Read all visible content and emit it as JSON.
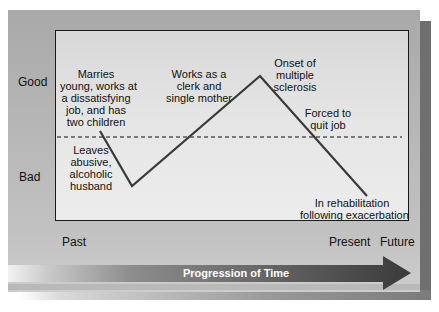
{
  "y_axis": {
    "good_label": "Good",
    "bad_label": "Bad"
  },
  "x_axis": {
    "past_label": "Past",
    "present_label": "Present",
    "future_label": "Future"
  },
  "arrow": {
    "label": "Progression of Time"
  },
  "events": [
    {
      "id": "marries",
      "text": "Marries young, works at a dissatisfying job, and has two children",
      "lines": [
        "Marries",
        "young, works at",
        "a dissatisfying",
        "job, and has",
        "two children"
      ],
      "level": "good"
    },
    {
      "id": "leaves",
      "text": "Leaves abusive, alcoholic husband",
      "lines": [
        "Leaves",
        "abusive,",
        "alcoholic",
        "husband"
      ],
      "level": "bad"
    },
    {
      "id": "works",
      "text": "Works as a clerk and single mother",
      "lines": [
        "Works as a",
        "clerk and",
        "single mother"
      ],
      "level": "good"
    },
    {
      "id": "onset",
      "text": "Onset of multiple sclerosis",
      "lines": [
        "Onset of",
        "multiple",
        "sclerosis"
      ],
      "level": "peak"
    },
    {
      "id": "forced",
      "text": "Forced to quit job",
      "lines": [
        "Forced to",
        "quit job"
      ],
      "level": "neutral"
    },
    {
      "id": "rehab",
      "text": "In rehabilitation following exacerbation",
      "lines": [
        "In rehabilitation",
        "following exacerbation"
      ],
      "level": "bad"
    }
  ],
  "trajectory_points": [
    [
      100,
      131
    ],
    [
      132,
      186
    ],
    [
      260,
      76
    ],
    [
      367,
      196
    ]
  ],
  "colors": {
    "line": "#3a3a3a",
    "panel": "#b4b4b4",
    "plot_bg": "#e4e4e4",
    "arrow": "#4a4a4a",
    "shadow": "#6f6f6f"
  }
}
